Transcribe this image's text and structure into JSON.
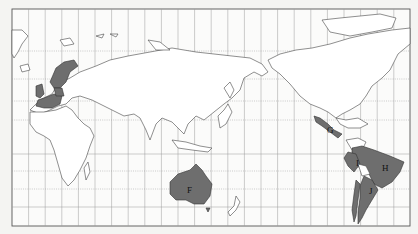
{
  "map": {
    "projection": "world map centered on Pacific (approx. 150°E)",
    "highlight_color": "#6e6e6e",
    "land_color": "#ffffff",
    "background_color": "#f4f4f2",
    "labels": [
      {
        "id": "F",
        "text": "F",
        "region": "Australia"
      },
      {
        "id": "G",
        "text": "G",
        "region": "Mexico"
      },
      {
        "id": "H",
        "text": "H",
        "region": "Brazil"
      },
      {
        "id": "I",
        "text": "I",
        "region": "Peru"
      },
      {
        "id": "J",
        "text": "J",
        "region": "Argentina"
      }
    ],
    "unlabeled_highlighted": [
      "Western Europe (UK, France, Germany, Benelux)",
      "Scandinavia (Norway, Sweden)",
      "Chile",
      "Uruguay"
    ]
  }
}
